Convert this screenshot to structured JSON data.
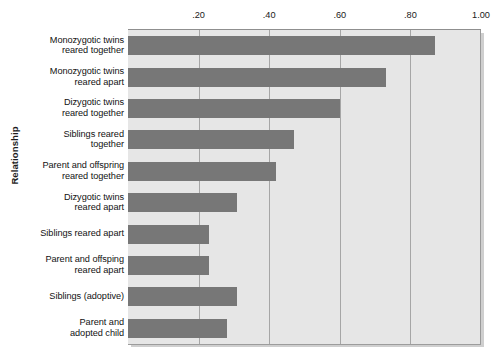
{
  "chart_data": {
    "type": "bar",
    "orientation": "horizontal",
    "title": "",
    "xlabel": "",
    "ylabel": "Relationship",
    "xlim": [
      0,
      1.0
    ],
    "xticks": [
      ".20",
      ".40",
      ".60",
      ".80",
      "1.00"
    ],
    "xtick_values": [
      0.2,
      0.4,
      0.6,
      0.8,
      1.0
    ],
    "grid": true,
    "legend": false,
    "axis_position": "top",
    "categories": [
      "Monozygotic twins reared together",
      "Monozygotic twins reared apart",
      "Dizygotic twins reared together",
      "Siblings reared together",
      "Parent and offspring reared together",
      "Dizygotic twins reared apart",
      "Siblings reared apart",
      "Parent and offsping reared apart",
      "Siblings (adoptive)",
      "Parent and adopted child"
    ],
    "category_lines": [
      [
        "Monozygotic twins",
        "reared together"
      ],
      [
        "Monozygotic twins",
        "reared apart"
      ],
      [
        "Dizygotic twins",
        "reared together"
      ],
      [
        "Siblings reared",
        "together"
      ],
      [
        "Parent and offspring",
        "reared together"
      ],
      [
        "Dizygotic twins",
        "reared apart"
      ],
      [
        "Siblings reared apart",
        ""
      ],
      [
        "Parent and offsping",
        "reared apart"
      ],
      [
        "Siblings (adoptive)",
        ""
      ],
      [
        "Parent and",
        "adopted child"
      ]
    ],
    "values": [
      0.87,
      0.73,
      0.6,
      0.47,
      0.42,
      0.31,
      0.23,
      0.23,
      0.31,
      0.28
    ],
    "bar_color": "#777777",
    "plot_background": "#e6e6e6",
    "gridline_color": "#a6a6a6"
  }
}
